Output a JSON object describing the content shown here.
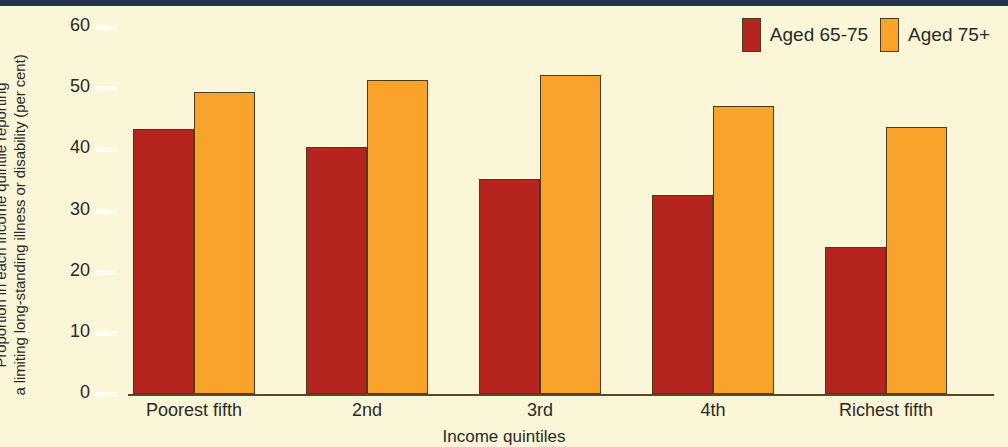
{
  "chart_data": {
    "type": "bar",
    "title": "",
    "subtitle": "",
    "xlabel": "Income quintiles",
    "ylabel": "Proportion in each income quintile reporting a limiting long-standing illness or disability (per cent)",
    "ylabel_line1": "Proportion in each income quintile reporting",
    "ylabel_line2": "a limiting long-standing illness or disability (per cent)",
    "categories": [
      "Poorest fifth",
      "2nd",
      "3rd",
      "4th",
      "Richest fifth"
    ],
    "series": [
      {
        "name": "Aged 65-75",
        "color": "#b5241e",
        "values": [
          43.3,
          40.3,
          35.2,
          32.6,
          24.1
        ]
      },
      {
        "name": "Aged 75+",
        "color": "#f9a32a",
        "values": [
          49.4,
          51.3,
          52.2,
          47.1,
          43.6
        ]
      }
    ],
    "ylim": [
      0,
      60
    ],
    "yticks": [
      0,
      10,
      20,
      30,
      40,
      50,
      60
    ],
    "ytick_labels": [
      "0",
      "10",
      "20",
      "30",
      "40",
      "50",
      "60"
    ],
    "grid": false,
    "legend_position": "top-right"
  },
  "legend": {
    "items": [
      {
        "label": "Aged 65-75",
        "color": "#b5241e"
      },
      {
        "label": "Aged 75+",
        "color": "#f9a32a"
      }
    ]
  },
  "colors": {
    "background": "#faf6d7",
    "top_strip": "#25314a",
    "series_1": "#b5241e",
    "series_2": "#f9a32a",
    "axis": "#5a4a24",
    "text": "#2a2a28"
  }
}
